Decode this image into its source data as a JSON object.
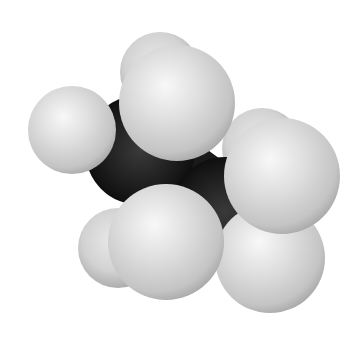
{
  "image": {
    "subject": "Space-filling molecular model of ethane",
    "background": "#ffffff",
    "atoms": {
      "carbon_color": "#1a1a1a",
      "hydrogen_color": "#d9d9d9",
      "hydrogen_highlight": "#f7f7f7",
      "hydrogen_shadow": "#9a9a9a"
    },
    "carbons": [
      {
        "id": "C1",
        "cx": 140,
        "cy": 150,
        "r": 55
      },
      {
        "id": "C2",
        "cx": 225,
        "cy": 212,
        "r": 55
      }
    ],
    "hydrogens_back": [
      {
        "id": "H-back-top",
        "cx": 160,
        "cy": 72,
        "r": 40
      },
      {
        "id": "H-back-right",
        "cx": 262,
        "cy": 148,
        "r": 40
      },
      {
        "id": "H-back-lowleft",
        "cx": 118,
        "cy": 248,
        "r": 40
      }
    ],
    "hydrogens_front": [
      {
        "id": "H-left",
        "cx": 72,
        "cy": 130,
        "r": 44
      },
      {
        "id": "H-upper",
        "cx": 177,
        "cy": 103,
        "r": 58
      },
      {
        "id": "H-right-low",
        "cx": 270,
        "cy": 258,
        "r": 55
      },
      {
        "id": "H-right",
        "cx": 282,
        "cy": 176,
        "r": 58
      },
      {
        "id": "H-bottom",
        "cx": 166,
        "cy": 242,
        "r": 58
      }
    ]
  }
}
